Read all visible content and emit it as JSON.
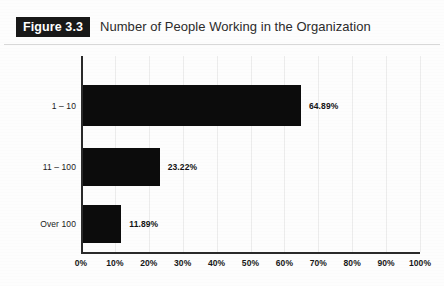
{
  "figure": {
    "badge_label": "Figure 3.3",
    "title": "Number of People Working in the Organization"
  },
  "chart_data": {
    "type": "bar",
    "orientation": "horizontal",
    "title": "Number of People Working in the Organization",
    "xlabel": "",
    "ylabel": "",
    "categories": [
      "1 – 10",
      "11 – 100",
      "Over 100"
    ],
    "values": [
      64.89,
      23.22,
      11.89
    ],
    "value_labels": [
      "64.89%",
      "23.22%",
      "11.89%"
    ],
    "xlim": [
      0,
      100
    ],
    "tick_labels": [
      "0%",
      "10%",
      "20%",
      "30%",
      "40%",
      "50%",
      "60%",
      "70%",
      "80%",
      "90%",
      "100%"
    ],
    "tick_values": [
      0,
      10,
      20,
      30,
      40,
      50,
      60,
      70,
      80,
      90,
      100
    ],
    "grid": true,
    "legend": null,
    "bar_color": "#0c0c0c",
    "axis_color": "#2a2a2a",
    "background": "#fdfdfd"
  }
}
